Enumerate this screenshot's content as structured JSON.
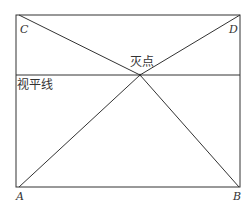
{
  "diagram": {
    "title": "",
    "labels": {
      "C": "C",
      "D": "D",
      "A": "A",
      "B": "B",
      "vanishing_point": "灭点",
      "horizon_line": "视平线"
    },
    "colors": {
      "stroke": "#333333",
      "background": "#ffffff"
    },
    "geometry": {
      "rect": {
        "left": 16,
        "top": 15,
        "right": 240,
        "bottom": 187
      },
      "horizon_y": 75,
      "vanishing_point": {
        "x": 140,
        "y": 75
      }
    }
  }
}
